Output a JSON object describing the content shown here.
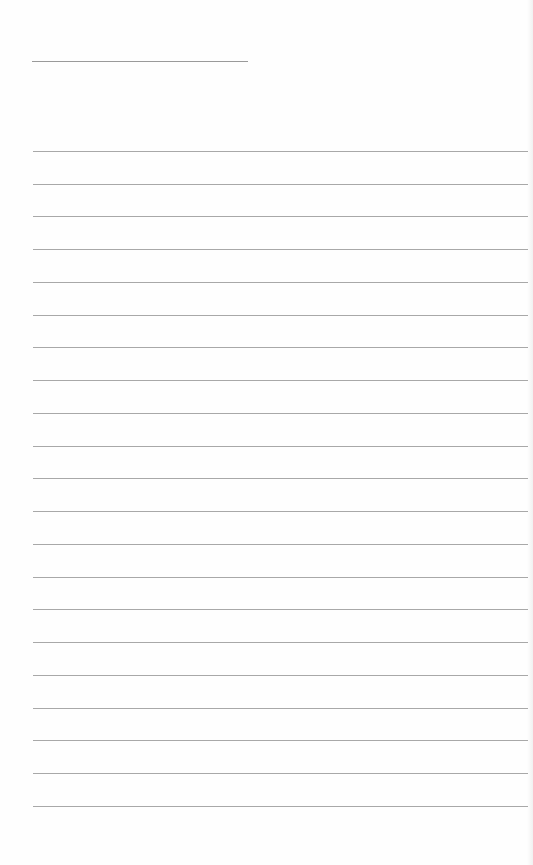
{
  "page": {
    "type": "lined-paper",
    "background": "#fefefe",
    "line_color": "#a8a8a8",
    "header_line": {
      "label": ""
    },
    "ruled_line_count": 21,
    "ruled_lines": [
      {
        "y": 151
      },
      {
        "y": 184
      },
      {
        "y": 216
      },
      {
        "y": 249
      },
      {
        "y": 282
      },
      {
        "y": 315
      },
      {
        "y": 347
      },
      {
        "y": 380
      },
      {
        "y": 413
      },
      {
        "y": 446
      },
      {
        "y": 478
      },
      {
        "y": 511
      },
      {
        "y": 544
      },
      {
        "y": 577
      },
      {
        "y": 609
      },
      {
        "y": 642
      },
      {
        "y": 675
      },
      {
        "y": 708
      },
      {
        "y": 740
      },
      {
        "y": 773
      },
      {
        "y": 806
      }
    ]
  }
}
